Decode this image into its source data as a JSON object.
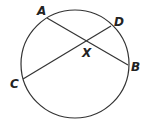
{
  "diagram": {
    "type": "circle-with-intersecting-chords",
    "colors": {
      "stroke": "#333333",
      "text": "#222222",
      "background": "#ffffff"
    },
    "circle": {
      "cx": 75,
      "cy": 64,
      "r": 54
    },
    "points": {
      "A": {
        "label": "A",
        "x": 47,
        "y": 18,
        "lx": 37,
        "ly": 15
      },
      "B": {
        "label": "B",
        "x": 128,
        "y": 65,
        "lx": 131,
        "ly": 71
      },
      "C": {
        "label": "C",
        "x": 23,
        "y": 79,
        "lx": 10,
        "ly": 88
      },
      "D": {
        "label": "D",
        "x": 111,
        "y": 26,
        "lx": 114,
        "ly": 26
      },
      "X": {
        "label": "X",
        "x": 86,
        "y": 41,
        "lx": 82,
        "ly": 57
      }
    },
    "chords": [
      {
        "name": "AB",
        "from": "A",
        "to": "B"
      },
      {
        "name": "CD",
        "from": "C",
        "to": "D"
      }
    ]
  }
}
